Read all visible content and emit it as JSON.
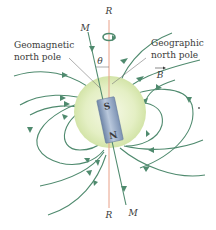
{
  "diagram": {
    "labels": {
      "rotation_axis_top": "R",
      "rotation_axis_bottom": "R",
      "magnetic_axis_top": "M",
      "magnetic_axis_bottom": "M",
      "angle": "θ",
      "geomagnetic_line1": "Geomagnetic",
      "geomagnetic_line2": "north pole",
      "geographic_line1": "Geographic",
      "geographic_line2": "north pole",
      "field_vector": "B",
      "magnet_south": "S",
      "magnet_north": "N"
    },
    "colors": {
      "field_line": "#4f8a6e",
      "rotation_axis": "#e8a088",
      "globe_fill": "#e4efc4",
      "globe_edge": "#cfe0a6",
      "magnet": "#9aaecb",
      "text": "#3a3a3a"
    }
  }
}
